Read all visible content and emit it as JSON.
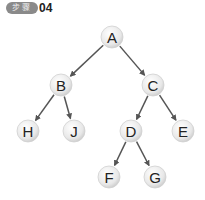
{
  "badge": {
    "label": "步骤",
    "number": "04"
  },
  "tree": {
    "nodes": [
      {
        "id": "A",
        "x": 112,
        "y": 37
      },
      {
        "id": "B",
        "x": 61,
        "y": 85
      },
      {
        "id": "C",
        "x": 153,
        "y": 85
      },
      {
        "id": "H",
        "x": 28,
        "y": 131
      },
      {
        "id": "J",
        "x": 74,
        "y": 131
      },
      {
        "id": "D",
        "x": 131,
        "y": 131
      },
      {
        "id": "E",
        "x": 183,
        "y": 131
      },
      {
        "id": "F",
        "x": 109,
        "y": 177
      },
      {
        "id": "G",
        "x": 155,
        "y": 177
      }
    ],
    "edges": [
      [
        "A",
        "B"
      ],
      [
        "A",
        "C"
      ],
      [
        "B",
        "H"
      ],
      [
        "B",
        "J"
      ],
      [
        "C",
        "D"
      ],
      [
        "C",
        "E"
      ],
      [
        "D",
        "F"
      ],
      [
        "D",
        "G"
      ]
    ]
  }
}
